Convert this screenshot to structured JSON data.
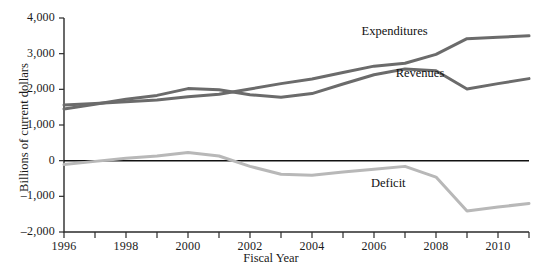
{
  "chart_data": {
    "type": "line",
    "title": "",
    "xlabel": "Fiscal Year",
    "ylabel": "Billions of current dollars",
    "xlim": [
      1996,
      2011
    ],
    "ylim": [
      -2000,
      4000
    ],
    "grid": false,
    "legend_position": "inline-annotations",
    "x": [
      1996,
      1997,
      1998,
      1999,
      2000,
      2001,
      2002,
      2003,
      2004,
      2005,
      2006,
      2007,
      2008,
      2009,
      2010,
      2011
    ],
    "xticks_major": [
      1996,
      1998,
      2000,
      2002,
      2004,
      2006,
      2008,
      2010
    ],
    "xticks_minor": [
      1997,
      1999,
      2001,
      2003,
      2005,
      2007,
      2009,
      2011
    ],
    "yticks": [
      -2000,
      -1000,
      0,
      1000,
      2000,
      3000,
      4000
    ],
    "ytick_labels": [
      "–2,000",
      "–1,000",
      "0",
      "1,000",
      "2,000",
      "3,000",
      "4,000"
    ],
    "xtick_labels": [
      "1996",
      "1998",
      "2000",
      "2002",
      "2004",
      "2006",
      "2008",
      "2010"
    ],
    "series": [
      {
        "name": "Expenditures",
        "color": "#6b6b6b",
        "label_x": 2005.6,
        "label_y": 3620,
        "values": [
          1560,
          1600,
          1650,
          1700,
          1790,
          1860,
          2010,
          2160,
          2290,
          2470,
          2650,
          2730,
          2980,
          3420,
          3460,
          3500
        ]
      },
      {
        "name": "Revenues",
        "color": "#6b6b6b",
        "label_x": 2006.7,
        "label_y": 2420,
        "values": [
          1450,
          1580,
          1720,
          1830,
          2020,
          1990,
          1850,
          1780,
          1880,
          2150,
          2410,
          2570,
          2520,
          2010,
          2160,
          2300
        ]
      },
      {
        "name": "Deficit",
        "color": "#b8b8b8",
        "label_x": 2005.9,
        "label_y": -650,
        "values": [
          -110,
          -20,
          70,
          130,
          230,
          130,
          -160,
          -380,
          -410,
          -320,
          -240,
          -160,
          -460,
          -1410,
          -1300,
          -1200
        ]
      }
    ]
  },
  "axes": {
    "ylabel_text": "Billions of current dollars",
    "xlabel_text": "Fiscal Year"
  }
}
